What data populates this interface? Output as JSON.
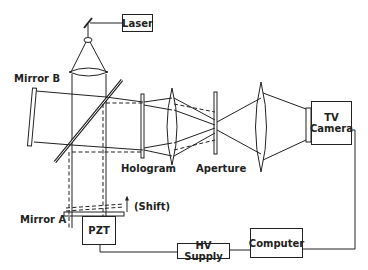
{
  "diagram": {
    "type": "optical-setup-schematic",
    "components": {
      "laser": "Laser",
      "mirror_b": "Mirror B",
      "mirror_a": "Mirror A",
      "hologram": "Hologram",
      "aperture": "Aperture",
      "tv_camera_line1": "TV",
      "tv_camera_line2": "Camera",
      "pzt": "PZT",
      "shift": "(Shift)",
      "hv_supply": "HV Supply",
      "computer": "Computer"
    },
    "connections": [
      {
        "from": "Laser",
        "to": "Small Mirror"
      },
      {
        "from": "Small Mirror",
        "to": "Lens"
      },
      {
        "from": "Lens",
        "to": "Beam Splitter"
      },
      {
        "from": "Beam Splitter",
        "to": "Mirror B"
      },
      {
        "from": "Beam Splitter",
        "to": "Mirror A"
      },
      {
        "from": "Beam Splitter",
        "to": "Hologram"
      },
      {
        "from": "Hologram",
        "to": "Lens"
      },
      {
        "from": "Lens",
        "to": "Aperture"
      },
      {
        "from": "Aperture",
        "to": "Lens"
      },
      {
        "from": "Lens",
        "to": "TV Camera"
      },
      {
        "from": "TV Camera",
        "to": "Computer"
      },
      {
        "from": "Computer",
        "to": "HV Supply"
      },
      {
        "from": "HV Supply",
        "to": "PZT"
      }
    ]
  }
}
